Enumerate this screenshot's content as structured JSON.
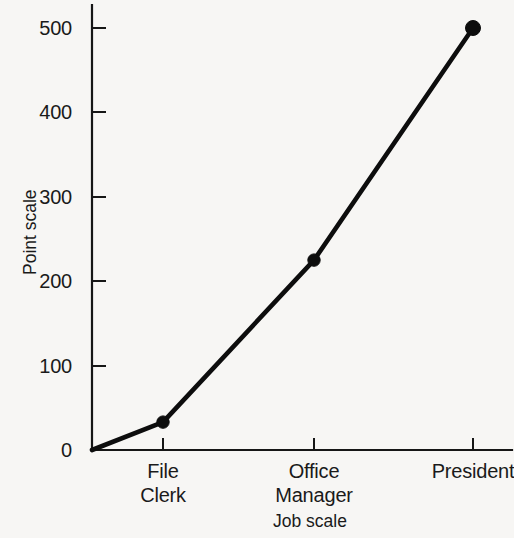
{
  "chart_data": {
    "type": "line",
    "title": "",
    "xlabel": "Job scale",
    "ylabel": "Point scale",
    "categories": [
      "File Clerk",
      "Office Manager",
      "President"
    ],
    "category_labels": [
      [
        "File",
        "Clerk"
      ],
      [
        "Office",
        "Manager"
      ],
      [
        "President"
      ]
    ],
    "values": [
      33,
      225,
      500
    ],
    "origin_value": 0,
    "yticks": [
      0,
      100,
      200,
      300,
      400,
      500
    ],
    "ytick_labels": [
      "0",
      "100",
      "200",
      "300",
      "400",
      "500"
    ],
    "ylim": [
      0,
      530
    ],
    "grid": false,
    "legend": false,
    "series": [
      {
        "name": "Point scale by job scale",
        "x": [
          "origin",
          "File Clerk",
          "Office Manager",
          "President"
        ],
        "values": [
          0,
          33,
          225,
          500
        ],
        "marker": "filled-circle",
        "markers_at": [
          "File Clerk",
          "Office Manager",
          "President"
        ],
        "color": "#0d0d0d"
      }
    ],
    "colors": {
      "background": "#f7f6f4",
      "ink": "#161616",
      "line": "#0d0d0d"
    }
  }
}
